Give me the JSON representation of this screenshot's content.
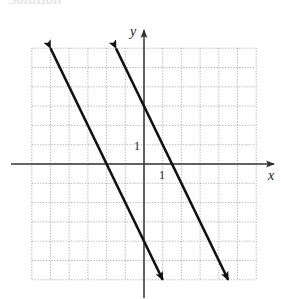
{
  "header": {
    "text": "Solution"
  },
  "chart_data": {
    "type": "line",
    "title": "",
    "xlabel": "x",
    "ylabel": "y",
    "xlim": [
      -6,
      6
    ],
    "ylim": [
      -6,
      6
    ],
    "grid": true,
    "grid_style": "dotted",
    "tick_labels": {
      "x": [
        "1"
      ],
      "y": [
        "1"
      ]
    },
    "series": [
      {
        "name": "line-1",
        "equation": "y = -2x - 4",
        "points": [
          [
            -5,
            6
          ],
          [
            1,
            -6
          ]
        ],
        "arrows": "both"
      },
      {
        "name": "line-2",
        "equation": "y = -2x + 3",
        "points": [
          [
            -1.5,
            6
          ],
          [
            4.5,
            -6
          ]
        ],
        "arrows": "both"
      }
    ],
    "legend": null
  },
  "axes": {
    "x_label": "x",
    "y_label": "y",
    "x_tick": "1",
    "y_tick": "1"
  },
  "colors": {
    "line": "#111111",
    "axis": "#333333",
    "grid": "#9a9a9a"
  }
}
